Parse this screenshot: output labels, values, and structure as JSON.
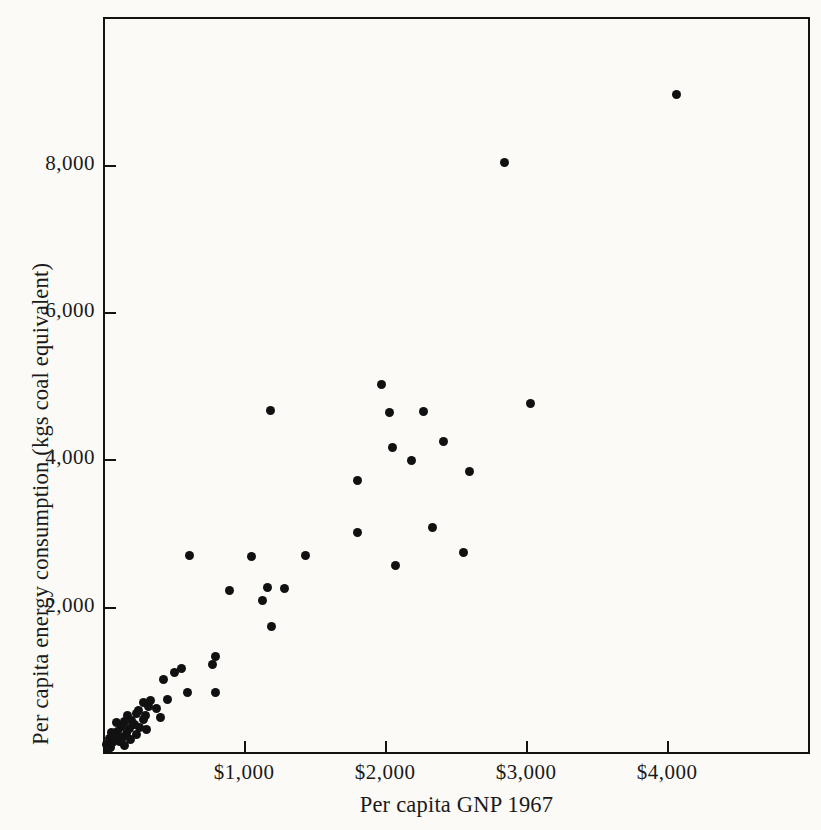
{
  "figure": {
    "background_color": "#fbfaf7",
    "ink_color": "#111111"
  },
  "chart_data": {
    "type": "scatter",
    "title": "",
    "xlabel": "Per capita GNP 1967",
    "ylabel": "Per capita energy consumption  (kgs coal equivalent)",
    "xlim": [
      0,
      5014
    ],
    "ylim": [
      0,
      10010
    ],
    "grid": false,
    "legend": null,
    "xticks": [
      1000,
      2000,
      3000,
      4000
    ],
    "xtick_labels": [
      "$1,000",
      "$2,000",
      "$3,000",
      "$4,000"
    ],
    "yticks": [
      2000,
      4000,
      6000,
      8000
    ],
    "ytick_labels": [
      "2,000",
      "4,000",
      "6,000",
      "8,000"
    ],
    "marker": "filled-circle",
    "marker_color": "#111111",
    "n_points": 64,
    "points": [
      [
        4065,
        8960
      ],
      [
        2845,
        8040
      ],
      [
        3035,
        4755
      ],
      [
        1975,
        5015
      ],
      [
        2030,
        4640
      ],
      [
        2270,
        4655
      ],
      [
        1190,
        4660
      ],
      [
        2050,
        4165
      ],
      [
        2415,
        4250
      ],
      [
        2185,
        3985
      ],
      [
        2600,
        3835
      ],
      [
        1805,
        3720
      ],
      [
        2340,
        3080
      ],
      [
        1805,
        3005
      ],
      [
        2555,
        2740
      ],
      [
        2075,
        2565
      ],
      [
        1435,
        2700
      ],
      [
        1050,
        2680
      ],
      [
        610,
        2690
      ],
      [
        1165,
        2260
      ],
      [
        1290,
        2245
      ],
      [
        895,
        2225
      ],
      [
        1130,
        2090
      ],
      [
        1195,
        1730
      ],
      [
        795,
        1325
      ],
      [
        780,
        1215
      ],
      [
        555,
        1160
      ],
      [
        505,
        1105
      ],
      [
        430,
        1010
      ],
      [
        795,
        840
      ],
      [
        600,
        830
      ],
      [
        460,
        745
      ],
      [
        340,
        720
      ],
      [
        290,
        700
      ],
      [
        320,
        640
      ],
      [
        380,
        620
      ],
      [
        255,
        595
      ],
      [
        235,
        555
      ],
      [
        300,
        520
      ],
      [
        175,
        520
      ],
      [
        410,
        500
      ],
      [
        285,
        470
      ],
      [
        205,
        450
      ],
      [
        150,
        440
      ],
      [
        95,
        425
      ],
      [
        225,
        395
      ],
      [
        130,
        380
      ],
      [
        260,
        360
      ],
      [
        185,
        340
      ],
      [
        310,
        330
      ],
      [
        105,
        310
      ],
      [
        60,
        295
      ],
      [
        165,
        275
      ],
      [
        235,
        260
      ],
      [
        90,
        245
      ],
      [
        140,
        230
      ],
      [
        45,
        215
      ],
      [
        195,
        195
      ],
      [
        115,
        175
      ],
      [
        70,
        150
      ],
      [
        25,
        130
      ],
      [
        150,
        110
      ],
      [
        55,
        85
      ],
      [
        30,
        55
      ]
    ]
  }
}
